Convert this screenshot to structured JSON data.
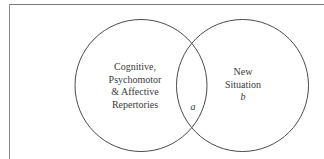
{
  "diagram": {
    "type": "venn",
    "frame_color": "#7a7a7a",
    "stroke_color": "#4a4a4a",
    "text_color": "#3a3a3a",
    "left_set": {
      "lines": [
        "Cognitive,",
        "Psychomotor",
        "& Affective",
        "Repertories"
      ]
    },
    "right_set": {
      "lines": [
        "New",
        "Situation"
      ],
      "letter": "b"
    },
    "intersection": {
      "letter": "a"
    }
  }
}
